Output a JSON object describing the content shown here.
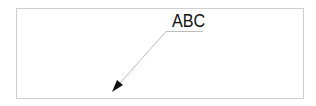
{
  "diagram": {
    "label_text": "ABC",
    "frame": {
      "x": 16,
      "y": 8,
      "width": 287,
      "height": 90,
      "stroke": "#cfcfcf"
    },
    "leader": {
      "shelf": {
        "x1": 166,
        "y1": 31,
        "x2": 203,
        "y2": 31
      },
      "slant": {
        "x1": 166,
        "y1": 31,
        "x2": 113,
        "y2": 91
      },
      "stroke": "#bdbdbd",
      "arrowhead_color": "#111111"
    }
  }
}
